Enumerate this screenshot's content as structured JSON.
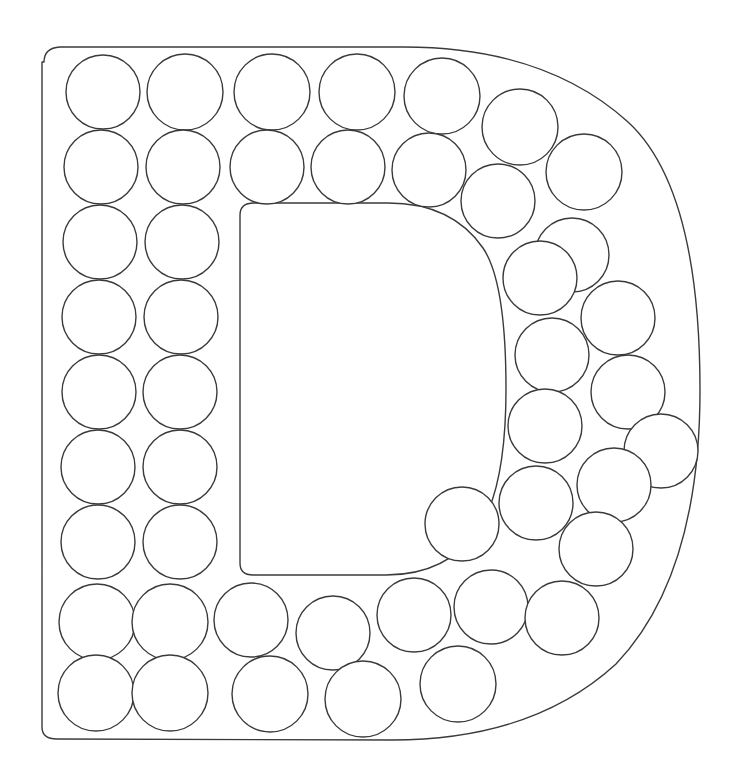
{
  "page": {
    "title": "Letter D Dot Marker Worksheet",
    "type": "line-art-letter-template",
    "background_color": "#ffffff",
    "stroke_color": "#3a3a3a",
    "fill_color": "#ffffff",
    "stroke_width": 1.4,
    "width": 739,
    "height": 773,
    "letter": "D",
    "dot_count": 51
  },
  "letter_shape": {
    "name": "uppercase-letter-d-outline",
    "outer_path": "M 44 62 Q 44 48 60 47 L 404 47 Q 545 47 628 122 Q 700 188 700 390 Q 700 576 616 664 Q 533 740 392 740 L 57 739 Q 42 739 42 727 L 42 62 Z",
    "inner_path": "M 240 215 Q 240 203 254 203 L 388 203 Q 452 203 483 248 Q 506 282 506 389 Q 506 489 478 530 Q 447 575 386 575 L 253 575 Q 240 575 240 563 L 240 215 Z"
  },
  "dots": {
    "name": "dot-marker-circles",
    "radius_default": 37,
    "items": [
      {
        "id": 1,
        "cx": 103,
        "cy": 92,
        "r": 37
      },
      {
        "id": 2,
        "cx": 185,
        "cy": 92,
        "r": 38
      },
      {
        "id": 3,
        "cx": 272,
        "cy": 92,
        "r": 38
      },
      {
        "id": 4,
        "cx": 357,
        "cy": 92,
        "r": 38
      },
      {
        "id": 5,
        "cx": 442,
        "cy": 96,
        "r": 38
      },
      {
        "id": 6,
        "cx": 520,
        "cy": 127,
        "r": 38
      },
      {
        "id": 7,
        "cx": 584,
        "cy": 172,
        "r": 38
      },
      {
        "id": 8,
        "cx": 101,
        "cy": 167,
        "r": 37
      },
      {
        "id": 9,
        "cx": 183,
        "cy": 167,
        "r": 37
      },
      {
        "id": 10,
        "cx": 267,
        "cy": 167,
        "r": 37
      },
      {
        "id": 11,
        "cx": 348,
        "cy": 167,
        "r": 37
      },
      {
        "id": 12,
        "cx": 429,
        "cy": 170,
        "r": 37
      },
      {
        "id": 13,
        "cx": 498,
        "cy": 201,
        "r": 37
      },
      {
        "id": 14,
        "cx": 572,
        "cy": 255,
        "r": 37
      },
      {
        "id": 15,
        "cx": 100,
        "cy": 242,
        "r": 37
      },
      {
        "id": 16,
        "cx": 182,
        "cy": 242,
        "r": 37
      },
      {
        "id": 17,
        "cx": 540,
        "cy": 278,
        "r": 37
      },
      {
        "id": 18,
        "cx": 618,
        "cy": 318,
        "r": 37
      },
      {
        "id": 19,
        "cx": 99,
        "cy": 317,
        "r": 37
      },
      {
        "id": 20,
        "cx": 181,
        "cy": 317,
        "r": 37
      },
      {
        "id": 21,
        "cx": 552,
        "cy": 355,
        "r": 37
      },
      {
        "id": 22,
        "cx": 628,
        "cy": 392,
        "r": 37
      },
      {
        "id": 23,
        "cx": 99,
        "cy": 392,
        "r": 37
      },
      {
        "id": 24,
        "cx": 180,
        "cy": 392,
        "r": 37
      },
      {
        "id": 25,
        "cx": 545,
        "cy": 426,
        "r": 37
      },
      {
        "id": 26,
        "cx": 661,
        "cy": 451,
        "r": 37
      },
      {
        "id": 27,
        "cx": 98,
        "cy": 467,
        "r": 37
      },
      {
        "id": 28,
        "cx": 180,
        "cy": 467,
        "r": 37
      },
      {
        "id": 29,
        "cx": 614,
        "cy": 485,
        "r": 37
      },
      {
        "id": 30,
        "cx": 536,
        "cy": 503,
        "r": 37
      },
      {
        "id": 31,
        "cx": 98,
        "cy": 542,
        "r": 37
      },
      {
        "id": 32,
        "cx": 180,
        "cy": 542,
        "r": 37
      },
      {
        "id": 33,
        "cx": 462,
        "cy": 524,
        "r": 37
      },
      {
        "id": 34,
        "cx": 596,
        "cy": 549,
        "r": 37
      },
      {
        "id": 35,
        "cx": 97,
        "cy": 622,
        "r": 38
      },
      {
        "id": 36,
        "cx": 170,
        "cy": 622,
        "r": 38
      },
      {
        "id": 37,
        "cx": 251,
        "cy": 620,
        "r": 37
      },
      {
        "id": 38,
        "cx": 333,
        "cy": 633,
        "r": 37
      },
      {
        "id": 39,
        "cx": 414,
        "cy": 615,
        "r": 37
      },
      {
        "id": 40,
        "cx": 491,
        "cy": 607,
        "r": 37
      },
      {
        "id": 41,
        "cx": 562,
        "cy": 618,
        "r": 37
      },
      {
        "id": 42,
        "cx": 96,
        "cy": 693,
        "r": 38
      },
      {
        "id": 43,
        "cx": 170,
        "cy": 693,
        "r": 38
      },
      {
        "id": 44,
        "cx": 270,
        "cy": 694,
        "r": 38
      },
      {
        "id": 45,
        "cx": 363,
        "cy": 699,
        "r": 38
      },
      {
        "id": 46,
        "cx": 458,
        "cy": 684,
        "r": 38
      },
      {
        "id": 47,
        "cx": 447,
        "cy": 434,
        "r": 0
      },
      {
        "id": 48,
        "cx": 0,
        "cy": 0,
        "r": 0
      },
      {
        "id": 49,
        "cx": 0,
        "cy": 0,
        "r": 0
      },
      {
        "id": 50,
        "cx": 0,
        "cy": 0,
        "r": 0
      },
      {
        "id": 51,
        "cx": 0,
        "cy": 0,
        "r": 0
      }
    ]
  }
}
